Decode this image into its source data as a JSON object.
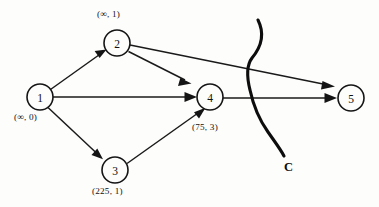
{
  "figure": {
    "background_color": "#fdfdfc",
    "ink_color": "#141414",
    "width": 379,
    "height": 207
  },
  "graph_data": {
    "type": "directed-graph",
    "nodes": [
      {
        "id": "1",
        "label": "1",
        "annotation": "(∞, 0)",
        "cx": 40,
        "cy": 97,
        "r": 13,
        "annotation_x": 14,
        "annotation_y": 112
      },
      {
        "id": "2",
        "label": "2",
        "annotation": "(∞, 1)",
        "cx": 117,
        "cy": 43,
        "r": 13,
        "annotation_x": 97,
        "annotation_y": 9
      },
      {
        "id": "3",
        "label": "3",
        "annotation": "(225, 1)",
        "cx": 115,
        "cy": 170,
        "r": 13,
        "annotation_x": 92,
        "annotation_y": 186
      },
      {
        "id": "4",
        "label": "4",
        "annotation": "(75, 3)",
        "cx": 210,
        "cy": 97,
        "r": 13,
        "annotation_x": 192,
        "annotation_y": 122
      },
      {
        "id": "5",
        "label": "5",
        "annotation": "",
        "cx": 351,
        "cy": 98,
        "r": 13,
        "annotation_x": 0,
        "annotation_y": 0
      }
    ],
    "edges": [
      {
        "from": "1",
        "to": "2",
        "directed": true
      },
      {
        "from": "1",
        "to": "3",
        "directed": true
      },
      {
        "from": "1",
        "to": "4",
        "directed": true
      },
      {
        "from": "2",
        "to": "4",
        "directed": true
      },
      {
        "from": "2",
        "to": "5",
        "directed": true
      },
      {
        "from": "3",
        "to": "4",
        "directed": true
      },
      {
        "from": "4",
        "to": "5",
        "directed": true
      }
    ],
    "cut": {
      "label": "C",
      "label_x": 284,
      "label_y": 160,
      "description": "s-shaped cut curve crossing edges 2-5 and 4-5"
    }
  }
}
